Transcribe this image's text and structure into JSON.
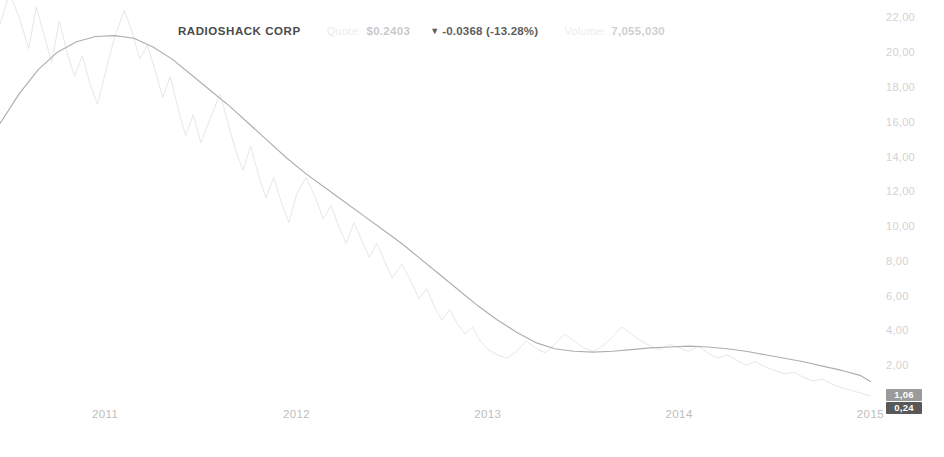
{
  "quote_bar": {
    "symbol": "RADIOSHACK CORP",
    "quote_label": "Quote:",
    "quote_value": "$0.2403",
    "change_arrow": "▼",
    "change_text": "-0.0368 (-13.28%)",
    "volume_label": "Volume:",
    "volume_value": "7,055,030"
  },
  "badges": [
    {
      "name": "moving-average-badge",
      "value": "1,06",
      "bg": "#9a9a9a"
    },
    {
      "name": "last-price-badge",
      "value": "0,24",
      "bg": "#585858"
    }
  ],
  "colors": {
    "background": "#ffffff",
    "price_line": "#e7e7e7",
    "ma_line": "#aeaeae",
    "axis_text": "#c8c8c8",
    "symbol_text": "#4a4a4a"
  },
  "chart_data": {
    "type": "line",
    "title": "RADIOSHACK CORP",
    "xlabel": "",
    "ylabel": "",
    "grid": false,
    "legend_position": "none",
    "xlim": [
      2010.45,
      2015.05
    ],
    "ylim": [
      0.0,
      23.0
    ],
    "y_ticks": [
      22,
      20,
      18,
      16,
      14,
      12,
      10,
      8,
      6,
      4,
      2
    ],
    "y_tick_labels": [
      "22,00",
      "20,00",
      "18,00",
      "16,00",
      "14,00",
      "12,00",
      "10,00",
      "8,00",
      "6,00",
      "4,00",
      "2,00"
    ],
    "x_ticks": [
      2011,
      2012,
      2013,
      2014,
      2015
    ],
    "x_tick_labels": [
      "2011",
      "2012",
      "2013",
      "2014",
      "2015"
    ],
    "series": [
      {
        "name": "Price",
        "color": "#e7e7e7",
        "x": [
          2010.45,
          2010.5,
          2010.55,
          2010.6,
          2010.64,
          2010.68,
          2010.72,
          2010.76,
          2010.8,
          2010.84,
          2010.88,
          2010.92,
          2010.96,
          2011.0,
          2011.05,
          2011.1,
          2011.14,
          2011.18,
          2011.22,
          2011.26,
          2011.3,
          2011.34,
          2011.38,
          2011.42,
          2011.46,
          2011.5,
          2011.55,
          2011.6,
          2011.64,
          2011.68,
          2011.72,
          2011.76,
          2011.8,
          2011.84,
          2011.88,
          2011.92,
          2011.96,
          2012.0,
          2012.05,
          2012.1,
          2012.14,
          2012.18,
          2012.22,
          2012.26,
          2012.3,
          2012.34,
          2012.38,
          2012.42,
          2012.46,
          2012.5,
          2012.55,
          2012.6,
          2012.64,
          2012.68,
          2012.72,
          2012.76,
          2012.8,
          2012.84,
          2012.88,
          2012.92,
          2012.96,
          2013.0,
          2013.05,
          2013.1,
          2013.15,
          2013.2,
          2013.25,
          2013.3,
          2013.35,
          2013.4,
          2013.45,
          2013.5,
          2013.55,
          2013.6,
          2013.65,
          2013.7,
          2013.75,
          2013.8,
          2013.85,
          2013.9,
          2013.95,
          2014.0,
          2014.05,
          2014.1,
          2014.15,
          2014.2,
          2014.25,
          2014.3,
          2014.35,
          2014.4,
          2014.45,
          2014.5,
          2014.55,
          2014.6,
          2014.65,
          2014.7,
          2014.75,
          2014.8,
          2014.85,
          2014.9,
          2014.95,
          2015.0
        ],
        "y": [
          21.6,
          23.4,
          22.0,
          20.2,
          22.6,
          21.0,
          19.4,
          21.8,
          20.0,
          18.6,
          19.8,
          18.2,
          17.0,
          18.8,
          20.9,
          22.4,
          21.2,
          19.6,
          20.4,
          19.0,
          17.4,
          18.6,
          16.8,
          15.2,
          16.4,
          14.8,
          16.2,
          17.6,
          16.0,
          14.4,
          13.2,
          14.6,
          13.0,
          11.6,
          12.8,
          11.4,
          10.2,
          11.8,
          12.8,
          11.6,
          10.4,
          11.2,
          10.0,
          9.0,
          10.2,
          9.2,
          8.2,
          9.0,
          8.0,
          7.0,
          7.8,
          6.8,
          5.8,
          6.4,
          5.4,
          4.6,
          5.2,
          4.4,
          3.8,
          4.2,
          3.4,
          2.9,
          2.6,
          2.4,
          2.8,
          3.4,
          3.0,
          2.7,
          3.2,
          3.8,
          3.4,
          3.0,
          2.8,
          3.1,
          3.6,
          4.2,
          3.8,
          3.4,
          3.1,
          2.9,
          3.2,
          3.0,
          2.8,
          3.1,
          2.7,
          2.4,
          2.6,
          2.3,
          2.0,
          2.2,
          1.9,
          1.7,
          1.5,
          1.6,
          1.3,
          1.1,
          1.2,
          0.9,
          0.7,
          0.55,
          0.4,
          0.24
        ]
      },
      {
        "name": "Moving Average",
        "color": "#aeaeae",
        "x": [
          2010.45,
          2010.55,
          2010.65,
          2010.75,
          2010.85,
          2010.95,
          2011.05,
          2011.15,
          2011.25,
          2011.35,
          2011.45,
          2011.55,
          2011.65,
          2011.75,
          2011.85,
          2011.95,
          2012.05,
          2012.15,
          2012.25,
          2012.35,
          2012.45,
          2012.55,
          2012.65,
          2012.75,
          2012.85,
          2012.95,
          2013.05,
          2013.15,
          2013.25,
          2013.35,
          2013.45,
          2013.55,
          2013.65,
          2013.75,
          2013.85,
          2013.95,
          2014.05,
          2014.15,
          2014.25,
          2014.35,
          2014.45,
          2014.55,
          2014.65,
          2014.75,
          2014.85,
          2014.95,
          2015.0
        ],
        "y": [
          15.9,
          17.6,
          19.0,
          20.0,
          20.6,
          20.9,
          20.95,
          20.8,
          20.3,
          19.6,
          18.7,
          17.8,
          16.9,
          15.9,
          14.9,
          13.9,
          13.0,
          12.2,
          11.4,
          10.6,
          9.8,
          9.0,
          8.1,
          7.2,
          6.3,
          5.4,
          4.6,
          3.9,
          3.3,
          2.95,
          2.8,
          2.75,
          2.8,
          2.9,
          3.0,
          3.05,
          3.1,
          3.05,
          2.95,
          2.8,
          2.6,
          2.4,
          2.2,
          1.95,
          1.7,
          1.4,
          1.06
        ]
      }
    ]
  }
}
